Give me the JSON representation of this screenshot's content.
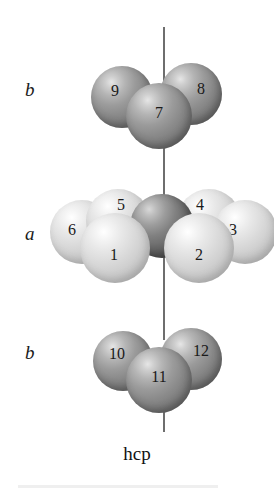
{
  "figure": {
    "title": "hcp",
    "caption": "hcp",
    "structure_name": "hexagonal close-packed",
    "background_color": "#ffffff",
    "axis_line_color": "#6e6e6e"
  },
  "layers": [
    {
      "id": "layer-top-b",
      "label": "b",
      "stacking_letter": "b",
      "atom_count": 3,
      "sphere_shade": "dark-gray",
      "atoms": [
        {
          "number": "9"
        },
        {
          "number": "8"
        },
        {
          "number": "7"
        }
      ]
    },
    {
      "id": "layer-middle-a",
      "label": "a",
      "stacking_letter": "a",
      "atom_count": 7,
      "sphere_shade": "light-gray",
      "atoms": [
        {
          "number": "5"
        },
        {
          "number": "4"
        },
        {
          "number": "6"
        },
        {
          "number": "3"
        },
        {
          "number": "1"
        },
        {
          "number": "2"
        },
        {
          "number": ""
        }
      ]
    },
    {
      "id": "layer-bottom-b",
      "label": "b",
      "stacking_letter": "b",
      "atom_count": 3,
      "sphere_shade": "dark-gray",
      "atoms": [
        {
          "number": "10"
        },
        {
          "number": "12"
        },
        {
          "number": "11"
        }
      ]
    }
  ],
  "labels": {
    "top_layer": "b",
    "middle_layer": "a",
    "bottom_layer": "b"
  },
  "atoms": {
    "a1": "1",
    "a2": "2",
    "a3": "3",
    "a4": "4",
    "a5": "5",
    "a6": "6",
    "a7": "7",
    "a8": "8",
    "a9": "9",
    "a10": "10",
    "a11": "11",
    "a12": "12"
  },
  "colors": {
    "sphere_dark": "#8a8a8a",
    "sphere_light": "#dcdcdc",
    "sphere_center_dark": "#6d6d6d",
    "text": "#1a1a1a",
    "axis": "#6e6e6e",
    "footer_rule": "#efefef"
  }
}
